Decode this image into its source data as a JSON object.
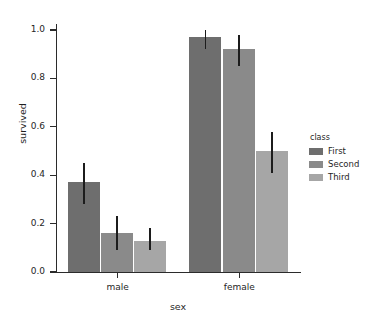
{
  "chart_data": {
    "type": "bar",
    "title": "",
    "xlabel": "sex",
    "ylabel": "survived",
    "categories": [
      "male",
      "female"
    ],
    "ylim": [
      0.0,
      1.0
    ],
    "yticks": [
      "0.0",
      "0.2",
      "0.4",
      "0.6",
      "0.8",
      "1.0"
    ],
    "ytick_values": [
      0.0,
      0.2,
      0.4,
      0.6,
      0.8,
      1.0
    ],
    "grid": false,
    "legend": {
      "title": "class",
      "position": "right",
      "entries": [
        "First",
        "Second",
        "Third"
      ]
    },
    "series": [
      {
        "name": "First",
        "color": "#6e6e6e",
        "values": [
          0.37,
          0.97
        ],
        "err_low": [
          0.28,
          0.92
        ],
        "err_high": [
          0.45,
          1.0
        ]
      },
      {
        "name": "Second",
        "color": "#8a8a8a",
        "values": [
          0.16,
          0.92
        ],
        "err_low": [
          0.09,
          0.85
        ],
        "err_high": [
          0.23,
          0.98
        ]
      },
      {
        "name": "Third",
        "color": "#a6a6a6",
        "values": [
          0.13,
          0.5
        ],
        "err_low": [
          0.09,
          0.41
        ],
        "err_high": [
          0.18,
          0.58
        ]
      }
    ]
  },
  "colors": {
    "background": "#ffffff",
    "axis": "#2b2b2b",
    "text": "#262626",
    "error_bar": "#1c1c1c"
  }
}
